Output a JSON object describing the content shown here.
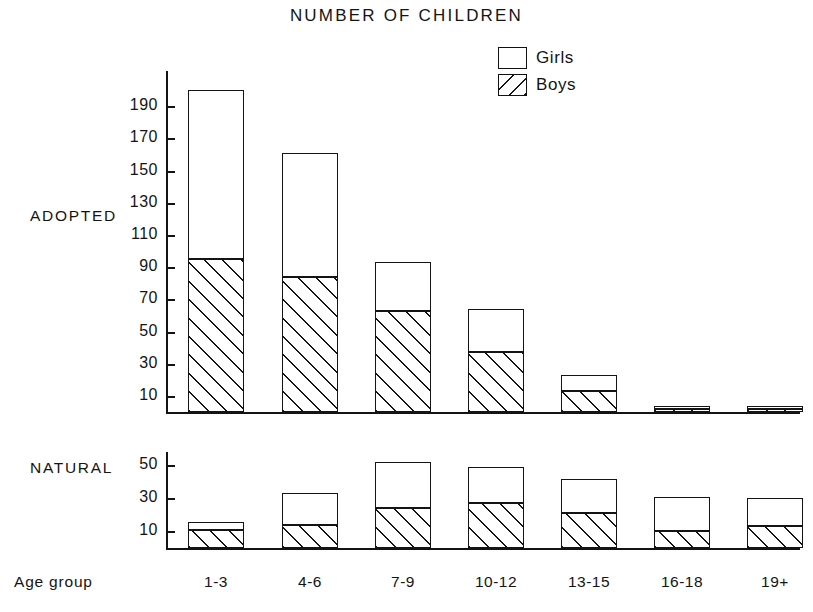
{
  "chart_data": {
    "type": "bar",
    "title": "NUMBER OF CHILDREN",
    "xlabel": "Age group",
    "categories": [
      "1-3",
      "4-6",
      "7-9",
      "10-12",
      "13-15",
      "16-18",
      "19+"
    ],
    "legend": {
      "position": "top-right",
      "entries": [
        {
          "name": "Girls",
          "pattern": "open"
        },
        {
          "name": "Boys",
          "pattern": "diagonal-hatch"
        }
      ]
    },
    "grid": false,
    "stacked": true,
    "panels": [
      {
        "name": "ADOPTED",
        "ylabel": "ADOPTED",
        "ylim": [
          0,
          210
        ],
        "yticks": [
          10,
          30,
          50,
          70,
          90,
          110,
          130,
          150,
          170,
          190
        ],
        "series": [
          {
            "name": "Boys",
            "values": [
              95,
              84,
              63,
              37,
              13,
              2,
              2
            ]
          },
          {
            "name": "Girls",
            "values": [
              105,
              77,
              30,
              27,
              10,
              2,
              2
            ]
          }
        ],
        "totals": [
          200,
          161,
          93,
          64,
          23,
          4,
          4
        ]
      },
      {
        "name": "NATURAL",
        "ylabel": "NATURAL",
        "ylim": [
          0,
          58
        ],
        "yticks": [
          10,
          30,
          50
        ],
        "series": [
          {
            "name": "Boys",
            "values": [
              11,
              14,
              24,
              27,
              21,
              10,
              13
            ]
          },
          {
            "name": "Girls",
            "values": [
              5,
              19,
              28,
              22,
              21,
              21,
              17
            ]
          }
        ],
        "totals": [
          16,
          33,
          52,
          49,
          42,
          31,
          30
        ]
      }
    ]
  },
  "title": "NUMBER OF CHILDREN",
  "legend": {
    "girls": "Girls",
    "boys": "Boys"
  },
  "labels": {
    "adopted": "ADOPTED",
    "natural": "NATURAL",
    "age_group": "Age  group"
  },
  "top_axis": {
    "ticks": [
      "190",
      "170",
      "150",
      "130",
      "110",
      "90",
      "70",
      "50",
      "30",
      "10"
    ]
  },
  "bottom_axis": {
    "ticks": [
      "50",
      "30",
      "10"
    ]
  },
  "categories": [
    "1-3",
    "4-6",
    "7-9",
    "10-12",
    "13-15",
    "16-18",
    "19+"
  ]
}
